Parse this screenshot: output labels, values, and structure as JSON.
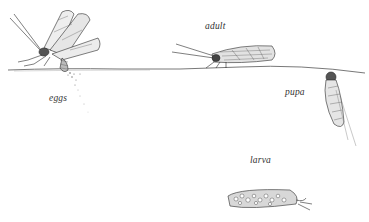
{
  "figure": {
    "labels": {
      "eggs": "eggs",
      "adult": "adult",
      "pupa": "pupa",
      "larva": "larva"
    },
    "colors": {
      "ink": "#2a2a2a",
      "background": "#ffffff",
      "label": "#333333"
    }
  }
}
